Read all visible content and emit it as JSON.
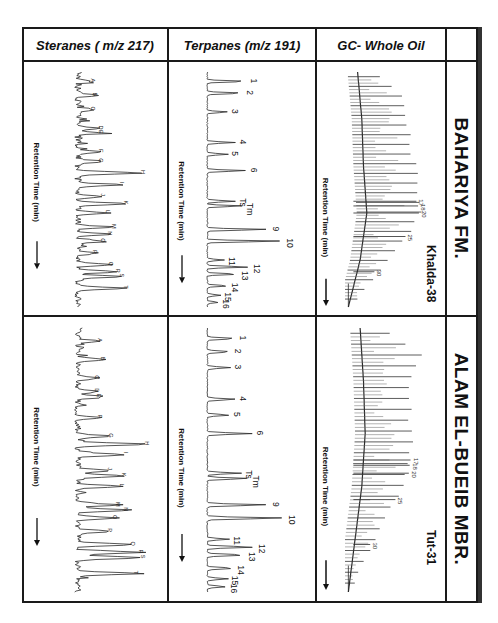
{
  "figure": {
    "formations": [
      {
        "key": "bahariya",
        "label": "BAHARIYA FM.",
        "well": "Khalda-38"
      },
      {
        "key": "alam",
        "label": "ALAM EL-BUEIB MBR.",
        "well": "Tut-31"
      }
    ],
    "rows": [
      {
        "key": "gc",
        "label": "GC- Whole Oil"
      },
      {
        "key": "terp",
        "label": "Terpanes (m/z 191)"
      },
      {
        "key": "ster",
        "label": "Steranes ( m/z 217)"
      }
    ],
    "x_axis_label": "Retention Time (min)",
    "line_color": "#2a2a2a"
  },
  "chart_data": [
    {
      "type": "line",
      "title": "GC- Whole Oil — Khalda-38 (Bahariya Fm.)",
      "xlabel": "Retention Time (min)",
      "ylabel": "",
      "peak_labels": [
        "17",
        "18",
        "20",
        "25",
        "30"
      ],
      "peaks": {
        "x": [
          0.55,
          0.57,
          0.6,
          0.7,
          0.85
        ],
        "y": [
          0.85,
          0.87,
          0.88,
          0.72,
          0.35
        ]
      },
      "envelope": {
        "x": [
          0.0,
          0.1,
          0.2,
          0.3,
          0.4,
          0.5,
          0.6,
          0.7,
          0.8,
          0.9,
          1.0
        ],
        "y": [
          0.35,
          0.72,
          0.78,
          0.82,
          0.86,
          0.9,
          0.92,
          0.78,
          0.55,
          0.3,
          0.08
        ]
      },
      "hump": {
        "x": [
          0.0,
          0.2,
          0.4,
          0.6,
          0.8,
          1.0
        ],
        "y": [
          0.15,
          0.2,
          0.22,
          0.26,
          0.18,
          0.04
        ]
      }
    },
    {
      "type": "line",
      "title": "GC- Whole Oil — Tut-31 (Alam El-Bueib Mbr.)",
      "xlabel": "Retention Time (min)",
      "ylabel": "",
      "peak_labels": [
        "17",
        "18",
        "20",
        "25",
        "30"
      ],
      "peaks": {
        "x": [
          0.5,
          0.52,
          0.55,
          0.65,
          0.82
        ],
        "y": [
          0.78,
          0.77,
          0.76,
          0.6,
          0.3
        ]
      },
      "envelope": {
        "x": [
          0.0,
          0.1,
          0.2,
          0.3,
          0.4,
          0.5,
          0.6,
          0.7,
          0.8,
          0.9,
          1.0
        ],
        "y": [
          0.45,
          0.95,
          0.78,
          0.8,
          0.82,
          0.8,
          0.72,
          0.55,
          0.38,
          0.2,
          0.08
        ]
      },
      "hump": {
        "x": [
          0.0,
          0.2,
          0.4,
          0.6,
          0.8,
          1.0
        ],
        "y": [
          0.18,
          0.22,
          0.24,
          0.2,
          0.12,
          0.04
        ]
      }
    },
    {
      "type": "line",
      "title": "Terpanes (m/z 191) — Khalda-38",
      "xlabel": "Retention Time (min)",
      "peak_labels": [
        "1",
        "2",
        "3",
        "4",
        "5",
        "6",
        "Ts",
        "Tm",
        "9",
        "10",
        "11",
        "12",
        "13",
        "14",
        "15",
        "16"
      ],
      "peaks": {
        "x": [
          0.04,
          0.09,
          0.17,
          0.3,
          0.35,
          0.42,
          0.55,
          0.57,
          0.67,
          0.72,
          0.8,
          0.83,
          0.86,
          0.91,
          0.95,
          0.98
        ],
        "y": [
          0.42,
          0.38,
          0.22,
          0.3,
          0.22,
          0.42,
          0.3,
          0.38,
          0.65,
          0.8,
          0.18,
          0.45,
          0.32,
          0.22,
          0.14,
          0.12
        ]
      }
    },
    {
      "type": "line",
      "title": "Terpanes (m/z 191) — Tut-31",
      "xlabel": "Retention Time (min)",
      "peak_labels": [
        "1",
        "2",
        "3",
        "4",
        "5",
        "6",
        "Ts",
        "Tm",
        "9",
        "10",
        "11",
        "12",
        "13",
        "14",
        "15",
        "16"
      ],
      "peaks": {
        "x": [
          0.04,
          0.09,
          0.15,
          0.27,
          0.33,
          0.4,
          0.55,
          0.57,
          0.67,
          0.72,
          0.8,
          0.83,
          0.86,
          0.91,
          0.95,
          0.98
        ],
        "y": [
          0.3,
          0.25,
          0.25,
          0.3,
          0.24,
          0.48,
          0.36,
          0.44,
          0.65,
          0.82,
          0.24,
          0.5,
          0.4,
          0.28,
          0.22,
          0.2
        ]
      }
    },
    {
      "type": "line",
      "title": "Steranes (m/z 217) — Khalda-38",
      "xlabel": "Retention Time (min)",
      "peak_labels": [
        "A",
        "B",
        "C",
        "D",
        "E",
        "F",
        "G",
        "H",
        "I",
        "J",
        "K",
        "L",
        "M",
        "N",
        "O",
        "P",
        "Q",
        "R",
        "S",
        "T"
      ],
      "peaks": {
        "x": [
          0.04,
          0.1,
          0.16,
          0.24,
          0.26,
          0.34,
          0.38,
          0.43,
          0.48,
          0.53,
          0.56,
          0.6,
          0.66,
          0.69,
          0.72,
          0.77,
          0.82,
          0.85,
          0.87,
          0.92
        ],
        "y": [
          0.2,
          0.22,
          0.2,
          0.3,
          0.3,
          0.3,
          0.3,
          0.8,
          0.55,
          0.32,
          0.6,
          0.38,
          0.45,
          0.4,
          0.32,
          0.22,
          0.42,
          0.5,
          0.55,
          0.6
        ]
      }
    },
    {
      "type": "line",
      "title": "Steranes (m/z 217) — Tut-31",
      "xlabel": "Retention Time (min)",
      "peak_labels": [
        "A",
        "B",
        "C",
        "D",
        "E",
        "F",
        "G",
        "H",
        "I",
        "J",
        "K",
        "L",
        "M",
        "N",
        "O",
        "P",
        "Q",
        "R",
        "S",
        "T"
      ],
      "peaks": {
        "x": [
          0.05,
          0.12,
          0.19,
          0.24,
          0.26,
          0.34,
          0.41,
          0.44,
          0.48,
          0.54,
          0.56,
          0.6,
          0.67,
          0.69,
          0.72,
          0.77,
          0.82,
          0.85,
          0.87,
          0.93
        ],
        "y": [
          0.28,
          0.32,
          0.25,
          0.25,
          0.27,
          0.28,
          0.42,
          0.85,
          0.6,
          0.4,
          0.58,
          0.55,
          0.5,
          0.6,
          0.46,
          0.4,
          0.68,
          0.78,
          0.8,
          0.72
        ]
      }
    }
  ]
}
